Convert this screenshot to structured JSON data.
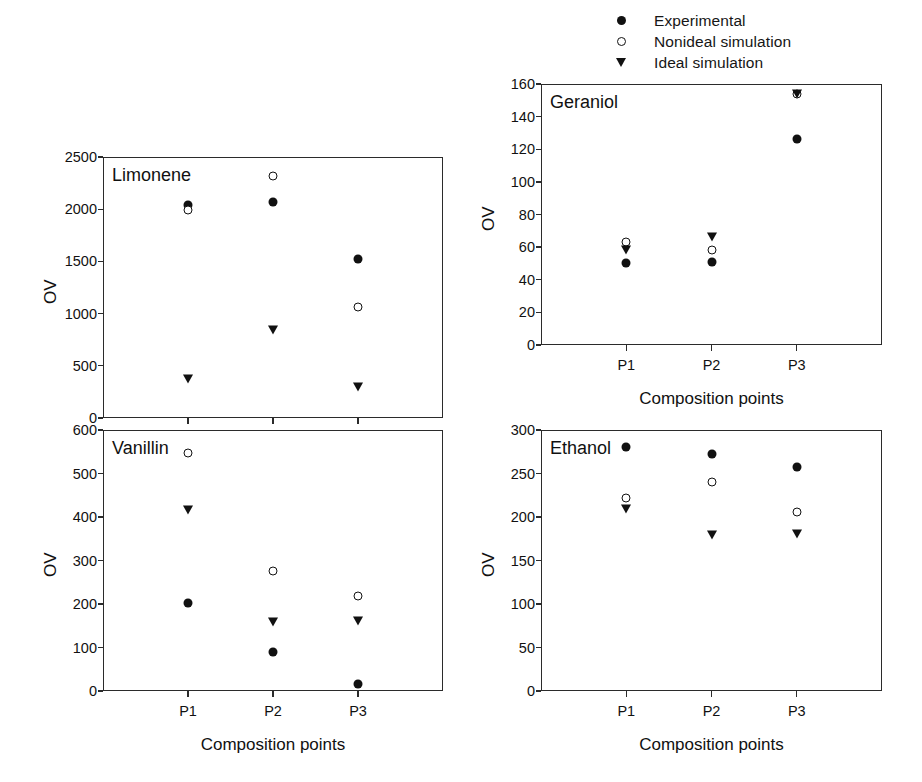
{
  "legend": {
    "items": [
      {
        "label": "Experimental",
        "marker": "filled-circle-icon"
      },
      {
        "label": "Nonideal simulation",
        "marker": "open-circle-icon"
      },
      {
        "label": "Ideal simulation",
        "marker": "filled-triangle-down-icon"
      }
    ]
  },
  "axis_label_y": "OV",
  "axis_label_x": "Composition points",
  "chart_data": [
    {
      "type": "scatter",
      "title": "Limonene",
      "xlabel": "Composition points",
      "ylabel": "OV",
      "categories": [
        "P1",
        "P2",
        "P3"
      ],
      "ylim": [
        0,
        2500
      ],
      "yticks": [
        0,
        500,
        1000,
        1500,
        2000,
        2500
      ],
      "grid": false,
      "legend_position": "figure-top-right",
      "series": [
        {
          "name": "Experimental",
          "marker": "filled-circle",
          "values": [
            2040,
            2070,
            1525
          ]
        },
        {
          "name": "Nonideal simulation",
          "marker": "open-circle",
          "values": [
            1990,
            2320,
            1065
          ]
        },
        {
          "name": "Ideal simulation",
          "marker": "filled-triangle-down",
          "values": [
            375,
            840,
            295
          ]
        }
      ]
    },
    {
      "type": "scatter",
      "title": "Geraniol",
      "xlabel": "Composition points",
      "ylabel": "OV",
      "categories": [
        "P1",
        "P2",
        "P3"
      ],
      "ylim": [
        0,
        160
      ],
      "yticks": [
        0,
        20,
        40,
        60,
        80,
        100,
        120,
        140,
        160
      ],
      "grid": false,
      "legend_position": "figure-top-right",
      "series": [
        {
          "name": "Experimental",
          "marker": "filled-circle",
          "values": [
            50,
            51,
            126
          ]
        },
        {
          "name": "Nonideal simulation",
          "marker": "open-circle",
          "values": [
            63,
            58,
            154
          ]
        },
        {
          "name": "Ideal simulation",
          "marker": "filled-triangle-down",
          "values": [
            58,
            66,
            154
          ]
        }
      ]
    },
    {
      "type": "scatter",
      "title": "Vanillin",
      "xlabel": "Composition points",
      "ylabel": "OV",
      "categories": [
        "P1",
        "P2",
        "P3"
      ],
      "ylim": [
        0,
        600
      ],
      "yticks": [
        0,
        100,
        200,
        300,
        400,
        500,
        600
      ],
      "grid": false,
      "legend_position": "figure-top-right",
      "series": [
        {
          "name": "Experimental",
          "marker": "filled-circle",
          "values": [
            203,
            90,
            15
          ]
        },
        {
          "name": "Nonideal simulation",
          "marker": "open-circle",
          "values": [
            547,
            276,
            218
          ]
        },
        {
          "name": "Ideal simulation",
          "marker": "filled-triangle-down",
          "values": [
            415,
            159,
            160
          ]
        }
      ]
    },
    {
      "type": "scatter",
      "title": "Ethanol",
      "xlabel": "Composition points",
      "ylabel": "OV",
      "categories": [
        "P1",
        "P2",
        "P3"
      ],
      "ylim": [
        0,
        300
      ],
      "yticks": [
        0,
        50,
        100,
        150,
        200,
        250,
        300
      ],
      "grid": false,
      "legend_position": "figure-top-right",
      "series": [
        {
          "name": "Experimental",
          "marker": "filled-circle",
          "values": [
            281,
            272,
            258
          ]
        },
        {
          "name": "Nonideal simulation",
          "marker": "open-circle",
          "values": [
            222,
            240,
            206
          ]
        },
        {
          "name": "Ideal simulation",
          "marker": "filled-triangle-down",
          "values": [
            209,
            179,
            180
          ]
        }
      ]
    }
  ]
}
